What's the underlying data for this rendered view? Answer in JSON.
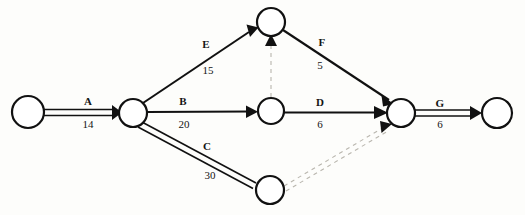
{
  "diagram": {
    "type": "activity-on-arrow-network",
    "title": "",
    "background_color": "#fdfdfb",
    "line_color": "#111111",
    "dummy_color": "#b9b6ae",
    "nodes": [
      {
        "id": "n1",
        "name": "start-node",
        "cx": 28,
        "cy": 112,
        "r": 16
      },
      {
        "id": "n2",
        "name": "node-after-a",
        "cx": 133,
        "cy": 113,
        "r": 14
      },
      {
        "id": "n3",
        "name": "top-node",
        "cx": 271,
        "cy": 22,
        "r": 14
      },
      {
        "id": "n4",
        "name": "middle-node",
        "cx": 271,
        "cy": 111,
        "r": 13
      },
      {
        "id": "n5",
        "name": "bottom-node",
        "cx": 270,
        "cy": 190,
        "r": 14
      },
      {
        "id": "n6",
        "name": "merge-node",
        "cx": 401,
        "cy": 113,
        "r": 14
      },
      {
        "id": "n7",
        "name": "finish-node",
        "cx": 497,
        "cy": 113,
        "r": 15
      }
    ],
    "activities": [
      {
        "id": "A",
        "label": "A",
        "duration": "14",
        "from": "n1",
        "to": "n2",
        "style": "double",
        "critical": true,
        "label_x": 88,
        "label_y": 101,
        "duration_x": 88,
        "duration_y": 124
      },
      {
        "id": "E",
        "label": "E",
        "duration": "15",
        "from": "n2",
        "to": "n3",
        "style": "single",
        "critical": false,
        "label_x": 206,
        "label_y": 44,
        "duration_x": 208,
        "duration_y": 70
      },
      {
        "id": "B",
        "label": "B",
        "duration": "20",
        "from": "n2",
        "to": "n4",
        "style": "single",
        "critical": false,
        "label_x": 183,
        "label_y": 101,
        "duration_x": 184,
        "duration_y": 124
      },
      {
        "id": "C",
        "label": "C",
        "duration": "30",
        "from": "n2",
        "to": "n5",
        "style": "double",
        "critical": true,
        "label_x": 207,
        "label_y": 146,
        "duration_x": 210,
        "duration_y": 175
      },
      {
        "id": "F",
        "label": "F",
        "duration": "5",
        "from": "n3",
        "to": "n6",
        "style": "single",
        "critical": false,
        "label_x": 322,
        "label_y": 42,
        "duration_x": 320,
        "duration_y": 65
      },
      {
        "id": "D",
        "label": "D",
        "duration": "6",
        "from": "n4",
        "to": "n6",
        "style": "single",
        "critical": false,
        "label_x": 320,
        "label_y": 102,
        "duration_x": 320,
        "duration_y": 124
      },
      {
        "id": "G",
        "label": "G",
        "duration": "6",
        "from": "n6",
        "to": "n7",
        "style": "double",
        "critical": true,
        "label_x": 440,
        "label_y": 103,
        "duration_x": 440,
        "duration_y": 124
      }
    ],
    "dummy_activities": [
      {
        "id": "dummy-1",
        "name": "dummy-middle-to-top",
        "from": "n4",
        "to": "n3",
        "style": "dashed-single"
      },
      {
        "id": "dummy-2",
        "name": "dummy-bottom-to-merge",
        "from": "n5",
        "to": "n6",
        "style": "dashed-double"
      }
    ]
  }
}
